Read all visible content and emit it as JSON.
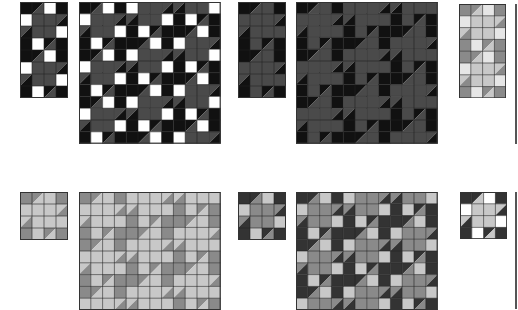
{
  "figure": {
    "colors": {
      "white": "#ffffff",
      "light": "#c8c8c8",
      "mid": "#8a8a8a",
      "dark": "#4a4a4a",
      "black": "#111111",
      "grid": "#222222"
    }
  },
  "panels": [
    {
      "id": "r1-block-a",
      "x": 20,
      "y": 2,
      "cols": 4,
      "rows": 8,
      "cell": 12,
      "palette": "bw"
    },
    {
      "id": "r1-field-a",
      "x": 79,
      "y": 2,
      "cols": 12,
      "rows": 12,
      "cell": 11.8,
      "palette": "bw"
    },
    {
      "id": "r1-block-b",
      "x": 238,
      "y": 2,
      "cols": 4,
      "rows": 8,
      "cell": 12,
      "palette": "dk"
    },
    {
      "id": "r1-field-b",
      "x": 296,
      "y": 2,
      "cols": 12,
      "rows": 12,
      "cell": 11.8,
      "palette": "dk"
    },
    {
      "id": "r1-block-c",
      "x": 459,
      "y": 4,
      "cols": 4,
      "rows": 8,
      "cell": 11.8,
      "palette": "lt"
    },
    {
      "id": "r2-block-a",
      "x": 20,
      "y": 192,
      "cols": 4,
      "rows": 4,
      "cell": 12,
      "palette": "gm"
    },
    {
      "id": "r2-field-a",
      "x": 79,
      "y": 192,
      "cols": 12,
      "rows": 10,
      "cell": 11.8,
      "palette": "gm"
    },
    {
      "id": "r2-block-b",
      "x": 238,
      "y": 192,
      "cols": 4,
      "rows": 4,
      "cell": 12,
      "palette": "gd"
    },
    {
      "id": "r2-field-b",
      "x": 296,
      "y": 192,
      "cols": 12,
      "rows": 10,
      "cell": 11.8,
      "palette": "gd"
    },
    {
      "id": "r2-block-c",
      "x": 460,
      "y": 192,
      "cols": 4,
      "rows": 4,
      "cell": 11.8,
      "palette": "mx"
    }
  ]
}
